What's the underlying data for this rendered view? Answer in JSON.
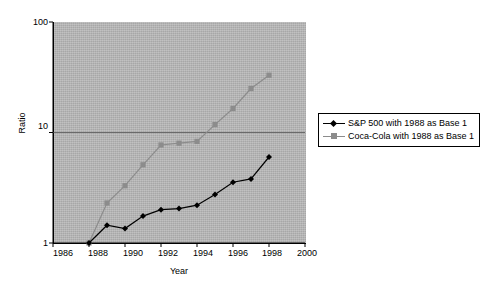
{
  "chart_data": {
    "type": "line",
    "title": "",
    "xlabel": "Year",
    "ylabel": "Ratio",
    "xlim": [
      1986,
      2000
    ],
    "ylim": [
      1,
      100
    ],
    "yscale": "log",
    "grid": true,
    "legend_position": "right",
    "x_ticks": [
      "1986",
      "1988",
      "1990",
      "1992",
      "1994",
      "1996",
      "1998",
      "2000"
    ],
    "y_ticks": [
      "1",
      "10",
      "100"
    ],
    "x": [
      1988,
      1989,
      1990,
      1991,
      1992,
      1993,
      1994,
      1995,
      1996,
      1997,
      1998
    ],
    "series": [
      {
        "name": "S&P 500 with 1988 as Base 1",
        "marker": "diamond",
        "color": "#000000",
        "values": [
          1,
          1.45,
          1.35,
          1.75,
          2.0,
          2.05,
          2.2,
          2.75,
          3.55,
          3.8,
          6.0
        ]
      },
      {
        "name": "Coca-Cola with 1988 as Base 1",
        "marker": "square",
        "color": "#8c8c8c",
        "values": [
          1,
          2.3,
          3.3,
          5.1,
          7.7,
          8.0,
          8.3,
          11.8,
          16.5,
          25.0,
          33.0
        ]
      }
    ]
  },
  "axes": {
    "y_title": "Ratio",
    "x_title": "Year",
    "y_ticks": [
      {
        "label": "100",
        "value": 100
      },
      {
        "label": "10",
        "value": 10
      },
      {
        "label": "1",
        "value": 1
      }
    ],
    "x_ticks": [
      {
        "label": "1986",
        "value": 1986
      },
      {
        "label": "1988",
        "value": 1988
      },
      {
        "label": "1990",
        "value": 1990
      },
      {
        "label": "1992",
        "value": 1992
      },
      {
        "label": "1994",
        "value": 1994
      },
      {
        "label": "1996",
        "value": 1996
      },
      {
        "label": "1998",
        "value": 1998
      },
      {
        "label": "2000",
        "value": 2000
      }
    ]
  },
  "legend": {
    "items": [
      {
        "label": "S&P 500 with 1988 as Base 1",
        "marker": "diamond",
        "color": "#000000"
      },
      {
        "label": "Coca-Cola with 1988 as Base 1",
        "marker": "square",
        "color": "#8c8c8c"
      }
    ]
  },
  "colors": {
    "plot_background": "#b4b4b4",
    "page_background": "#ffffff",
    "axis": "#000000",
    "gridline": "#6a6a6a",
    "series_sp500": "#000000",
    "series_cocacola": "#8c8c8c"
  }
}
